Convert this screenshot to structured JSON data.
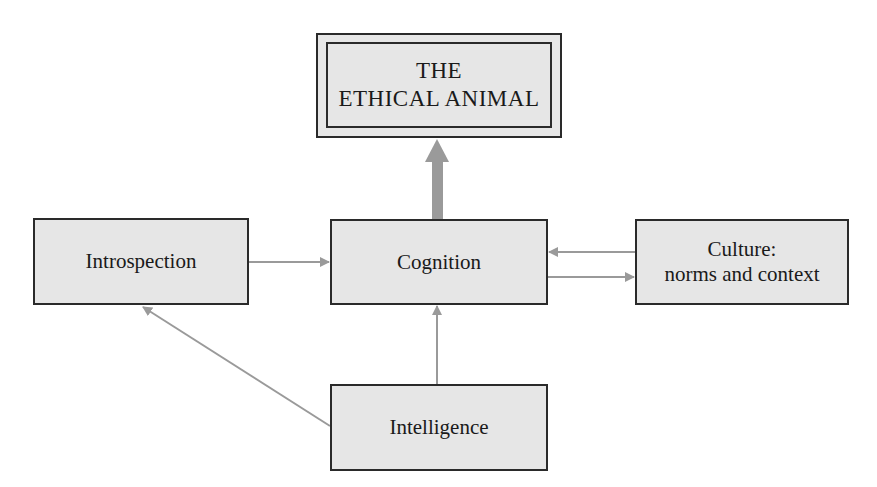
{
  "diagram": {
    "nodes": {
      "ethical_animal": {
        "line1": "THE",
        "line2": "ETHICAL ANIMAL"
      },
      "introspection": {
        "label": "Introspection"
      },
      "cognition": {
        "label": "Cognition"
      },
      "culture": {
        "line1": "Culture:",
        "line2": "norms and context"
      },
      "intelligence": {
        "label": "Intelligence"
      }
    },
    "edges": [
      {
        "from": "cognition",
        "to": "ethical_animal",
        "style": "thick"
      },
      {
        "from": "introspection",
        "to": "cognition",
        "style": "thin"
      },
      {
        "from": "culture",
        "to": "cognition",
        "style": "thin"
      },
      {
        "from": "cognition",
        "to": "culture",
        "style": "thin"
      },
      {
        "from": "intelligence",
        "to": "cognition",
        "style": "thin"
      },
      {
        "from": "intelligence",
        "to": "introspection",
        "style": "thin"
      }
    ],
    "colors": {
      "box_fill": "#e6e6e6",
      "box_border": "#2a2a2a",
      "arrow": "#9a9a9a"
    }
  }
}
